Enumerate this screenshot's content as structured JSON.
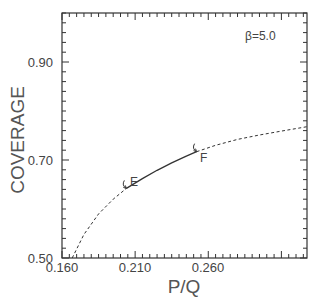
{
  "chart_data": {
    "type": "line",
    "title": "",
    "xlabel": "P/Q",
    "ylabel": "COVERAGE",
    "xlim": [
      0.16,
      0.3275
    ],
    "ylim": [
      0.5,
      1.0
    ],
    "x_ticks": [
      0.16,
      0.21,
      0.26
    ],
    "x_tick_labels": [
      "0.160",
      "0.210",
      "0.260"
    ],
    "y_ticks": [
      0.5,
      0.7,
      0.9
    ],
    "y_tick_labels": [
      "0.50",
      "0.70",
      "0.90"
    ],
    "grid": false,
    "annotation": "β=5.0",
    "series": [
      {
        "name": "unstable branch (left)",
        "style": "dashed",
        "x": [
          0.167,
          0.175,
          0.185,
          0.195,
          0.204
        ],
        "y": [
          0.5,
          0.548,
          0.59,
          0.62,
          0.642
        ]
      },
      {
        "name": "stable branch",
        "style": "solid",
        "x": [
          0.204,
          0.215,
          0.225,
          0.235,
          0.245,
          0.252
        ],
        "y": [
          0.642,
          0.662,
          0.679,
          0.694,
          0.708,
          0.717
        ]
      },
      {
        "name": "unstable branch (right)",
        "style": "dashed",
        "x": [
          0.252,
          0.265,
          0.28,
          0.295,
          0.31,
          0.3275
        ],
        "y": [
          0.717,
          0.73,
          0.742,
          0.751,
          0.759,
          0.768
        ]
      }
    ],
    "markers": [
      {
        "label": "E",
        "x": 0.204,
        "y": 0.642
      },
      {
        "label": "F",
        "x": 0.252,
        "y": 0.717
      }
    ]
  },
  "labels": {
    "x_axis_title": "P/Q",
    "y_axis_title": "COVERAGE",
    "annotation": "β=5.0",
    "x_ticks": [
      "0.160",
      "0.210",
      "0.260"
    ],
    "y_ticks": [
      "0.50",
      "0.70",
      "0.90"
    ],
    "marker_e": "E",
    "marker_f": "F"
  }
}
